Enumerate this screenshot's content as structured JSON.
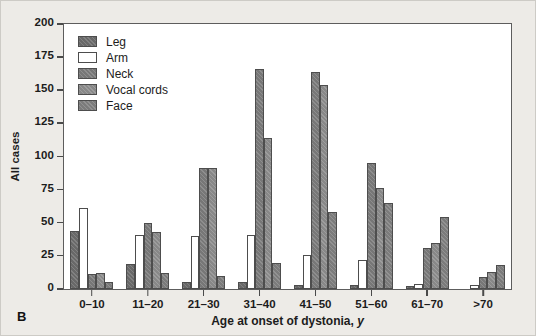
{
  "panel": {
    "label": "B"
  },
  "chart_data": {
    "type": "bar",
    "title": "",
    "xlabel": "Age at onset of dystonia, y",
    "xlabel_plain": "Age at onset of dystonia,",
    "xlabel_italic": "y",
    "ylabel": "All cases",
    "ylim": [
      0,
      200
    ],
    "yticks": [
      0,
      25,
      50,
      75,
      100,
      125,
      150,
      175,
      200
    ],
    "grid": false,
    "legend_position": "top-left",
    "categories": [
      "0–10",
      "11–20",
      "21–30",
      "31–40",
      "41–50",
      "51–60",
      "61–70",
      ">70"
    ],
    "series": [
      {
        "name": "Leg",
        "color": "#6e6e6e",
        "values": [
          44,
          19,
          5,
          5,
          3,
          3,
          2,
          0
        ]
      },
      {
        "name": "Arm",
        "color": "#ffffff",
        "values": [
          61,
          41,
          40,
          41,
          26,
          22,
          4,
          3
        ]
      },
      {
        "name": "Neck",
        "color": "#7d7d7d",
        "values": [
          11,
          50,
          91,
          166,
          164,
          95,
          31,
          9
        ]
      },
      {
        "name": "Vocal cords",
        "color": "#8f8f8f",
        "values": [
          12,
          43,
          91,
          114,
          154,
          76,
          35,
          13
        ]
      },
      {
        "name": "Face",
        "color": "#828282",
        "values": [
          5,
          12,
          10,
          20,
          58,
          65,
          54,
          18
        ]
      }
    ]
  }
}
